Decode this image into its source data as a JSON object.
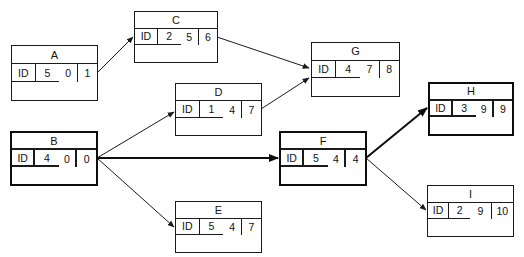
{
  "diagram": {
    "type": "activity-on-node network",
    "styles": {
      "line_color": "#1a1a1a",
      "background": "#ffffff"
    },
    "nodes": {
      "A": {
        "name": "A",
        "id_label": "ID",
        "duration": "5",
        "start": "0",
        "finish": "1",
        "critical": false
      },
      "B": {
        "name": "B",
        "id_label": "ID",
        "duration": "4",
        "start": "0",
        "finish": "0",
        "critical": true
      },
      "C": {
        "name": "C",
        "id_label": "ID",
        "duration": "2",
        "start": "5",
        "finish": "6",
        "critical": false
      },
      "D": {
        "name": "D",
        "id_label": "ID",
        "duration": "1",
        "start": "4",
        "finish": "7",
        "critical": false
      },
      "E": {
        "name": "E",
        "id_label": "ID",
        "duration": "5",
        "start": "4",
        "finish": "7",
        "critical": false
      },
      "F": {
        "name": "F",
        "id_label": "ID",
        "duration": "5",
        "start": "4",
        "finish": "4",
        "critical": true
      },
      "G": {
        "name": "G",
        "id_label": "ID",
        "duration": "4",
        "start": "7",
        "finish": "8",
        "critical": false
      },
      "H": {
        "name": "H",
        "id_label": "ID",
        "duration": "3",
        "start": "9",
        "finish": "9",
        "critical": true
      },
      "I": {
        "name": "I",
        "id_label": "ID",
        "duration": "2",
        "start": "9",
        "finish": "10",
        "critical": false
      }
    },
    "edges": [
      {
        "from": "A",
        "to": "C",
        "critical": false
      },
      {
        "from": "C",
        "to": "G",
        "critical": false
      },
      {
        "from": "D",
        "to": "G",
        "critical": false
      },
      {
        "from": "B",
        "to": "D",
        "critical": false
      },
      {
        "from": "B",
        "to": "F",
        "critical": true
      },
      {
        "from": "B",
        "to": "E",
        "critical": false
      },
      {
        "from": "F",
        "to": "H",
        "critical": true
      },
      {
        "from": "F",
        "to": "I",
        "critical": false
      }
    ]
  }
}
